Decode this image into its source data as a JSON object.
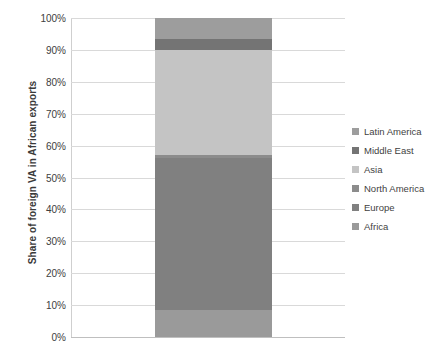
{
  "chart_data": {
    "type": "bar",
    "title": "",
    "subtitle": "",
    "xlabel": "",
    "ylabel": "Share of foreign VA in African exports",
    "stacked": true,
    "stack_total": 100,
    "grid": true,
    "legend_position": "right",
    "ylim": [
      0,
      100
    ],
    "ytick_labels": [
      "100%",
      "90%",
      "80%",
      "70%",
      "60%",
      "50%",
      "40%",
      "30%",
      "20%",
      "10%",
      "0%"
    ],
    "ytick_values": [
      100,
      90,
      80,
      70,
      60,
      50,
      40,
      30,
      20,
      10,
      0
    ],
    "categories": [
      "Africa exports"
    ],
    "series": [
      {
        "name": "Africa",
        "values": [
          8.5
        ],
        "color": "#9a9a9a",
        "from": 0.0,
        "to": 8.5
      },
      {
        "name": "Europe",
        "values": [
          47.5
        ],
        "color": "#808080",
        "from": 8.5,
        "to": 56.0
      },
      {
        "name": "North America",
        "values": [
          1.0
        ],
        "color": "#8c8c8c",
        "from": 56.0,
        "to": 57.0
      },
      {
        "name": "Asia",
        "values": [
          33.0
        ],
        "color": "#c4c4c4",
        "from": 57.0,
        "to": 90.0
      },
      {
        "name": "Middle East",
        "values": [
          3.5
        ],
        "color": "#747474",
        "from": 90.0,
        "to": 93.5
      },
      {
        "name": "Latin America",
        "values": [
          6.5
        ],
        "color": "#9d9d9d",
        "from": 93.5,
        "to": 100.0
      }
    ],
    "legend_entries": [
      {
        "label": "Latin America",
        "color": "#9d9d9d"
      },
      {
        "label": "Middle East",
        "color": "#747474"
      },
      {
        "label": "Asia",
        "color": "#c4c4c4"
      },
      {
        "label": "North America",
        "color": "#8c8c8c"
      },
      {
        "label": "Europe",
        "color": "#808080"
      },
      {
        "label": "Africa",
        "color": "#9a9a9a"
      }
    ]
  },
  "colors": {
    "gridline": "#d9d9d9",
    "axis": "#cfcfcf",
    "text": "#3f3f3f",
    "background": "#ffffff"
  }
}
